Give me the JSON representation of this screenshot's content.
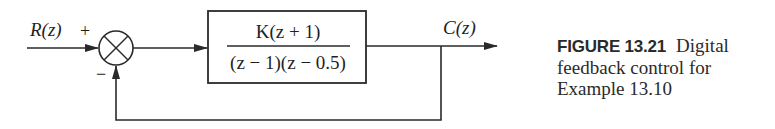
{
  "diagram": {
    "input_label": "R(z)",
    "output_label": "C(z)",
    "summing_junction": {
      "plus_sign": "+",
      "minus_sign": "−"
    },
    "block": {
      "numerator": "K(z + 1)",
      "denominator": "(z − 1)(z − 0.5)"
    },
    "line_color": "#2a2a2a"
  },
  "caption": {
    "figure_label": "FIGURE 13.21",
    "text_line1": "Digital",
    "text_line2": "feedback control for",
    "text_line3": "Example 13.10"
  }
}
